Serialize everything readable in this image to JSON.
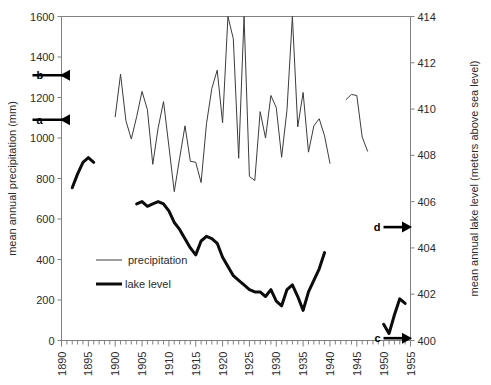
{
  "chart_data": {
    "type": "line",
    "title": "",
    "xlabel": "",
    "ylabel": "mean annual precipitation (mm)",
    "y2label": "mean annual lake level (meters above sea level)",
    "xlim": [
      1890,
      1955
    ],
    "ylim": [
      0,
      1600
    ],
    "y2lim": [
      400,
      414
    ],
    "grid": false,
    "legend_position": "inside-left-lower",
    "x_ticks": [
      1890,
      1895,
      1900,
      1905,
      1910,
      1915,
      1920,
      1925,
      1930,
      1935,
      1940,
      1945,
      1950,
      1955
    ],
    "x_minor_tick_interval": 1,
    "y_ticks": [
      0,
      200,
      400,
      600,
      800,
      1000,
      1200,
      1400,
      1600
    ],
    "y2_ticks": [
      400,
      402,
      404,
      406,
      408,
      410,
      412,
      414
    ],
    "series": [
      {
        "name": "precipitation",
        "axis": "left",
        "units": "mm",
        "color": "#3c3c3c",
        "stroke_width": 1,
        "segments": [
          {
            "x": [
              1900,
              1901,
              1902,
              1903,
              1904,
              1905,
              1906,
              1907,
              1908,
              1909,
              1910,
              1911,
              1912,
              1913,
              1914,
              1915,
              1916,
              1917,
              1918,
              1919,
              1920,
              1921,
              1922,
              1923,
              1924,
              1925,
              1926,
              1927,
              1928,
              1929,
              1930,
              1931,
              1932,
              1933,
              1934,
              1935,
              1936,
              1937,
              1938,
              1939,
              1940
            ],
            "y": [
              1105,
              1315,
              1085,
              995,
              1105,
              1230,
              1140,
              870,
              1050,
              1180,
              960,
              735,
              900,
              1060,
              885,
              880,
              780,
              1070,
              1245,
              1335,
              1075,
              1600,
              1490,
              900,
              1600,
              810,
              790,
              1130,
              1000,
              1210,
              1150,
              905,
              1140,
              1600,
              1055,
              1225,
              930,
              1060,
              1095,
              1010,
              875
            ]
          },
          {
            "x": [
              1943,
              1944,
              1945,
              1946,
              1947
            ],
            "y": [
              1190,
              1215,
              1210,
              1005,
              935
            ]
          }
        ]
      },
      {
        "name": "lake level",
        "axis": "right",
        "units": "m",
        "color": "#0c0c0c",
        "stroke_width": 3,
        "segments": [
          {
            "x": [
              1892,
              1893,
              1894,
              1895,
              1896
            ],
            "y": [
              406.6,
              407.2,
              407.7,
              407.9,
              407.7
            ]
          },
          {
            "x": [
              1904,
              1905,
              1906,
              1907,
              1908,
              1909,
              1910,
              1911,
              1912,
              1913,
              1914,
              1915,
              1916,
              1917,
              1918,
              1919,
              1920,
              1921,
              1922,
              1923,
              1924,
              1925,
              1926,
              1927,
              1928,
              1929,
              1930,
              1931,
              1932,
              1933,
              1934,
              1935,
              1936,
              1937,
              1938,
              1939
            ],
            "y": [
              405.9,
              406.0,
              405.8,
              405.9,
              406.0,
              405.9,
              405.6,
              405.1,
              404.8,
              404.4,
              404.0,
              403.7,
              404.3,
              404.5,
              404.4,
              404.2,
              403.6,
              403.2,
              402.8,
              402.6,
              402.4,
              402.2,
              402.1,
              402.1,
              401.9,
              402.2,
              401.7,
              401.5,
              402.2,
              402.4,
              401.9,
              401.3,
              402.1,
              402.6,
              403.1,
              403.8
            ]
          },
          {
            "x": [
              1950,
              1951,
              1952,
              1953,
              1954
            ],
            "y": [
              400.7,
              400.3,
              401.1,
              401.8,
              401.6
            ]
          }
        ]
      }
    ],
    "annotations": [
      {
        "label": "a",
        "axis": "left",
        "value": 1090,
        "side": "left",
        "direction": "left"
      },
      {
        "label": "b",
        "axis": "left",
        "value": 1310,
        "side": "left",
        "direction": "left"
      },
      {
        "label": "c",
        "axis": "right",
        "value": 400.1,
        "side": "right",
        "direction": "right"
      },
      {
        "label": "d",
        "axis": "right",
        "value": 404.9,
        "side": "right",
        "direction": "right"
      }
    ],
    "legend": [
      {
        "label": "precipitation",
        "stroke_width": 1
      },
      {
        "label": "lake level",
        "stroke_width": 3
      }
    ]
  },
  "colors": {
    "axis": "#808080",
    "text": "#2b2b2b",
    "precipitation": "#3c3c3c",
    "lake_level": "#0c0c0c",
    "annotation": "#000000",
    "background": "#ffffff"
  }
}
